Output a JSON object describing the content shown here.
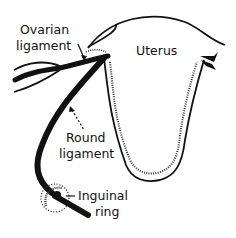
{
  "diagram": {
    "labels": {
      "ovarian_ligament": [
        "Ovarian",
        "ligament"
      ],
      "uterus": "Uterus",
      "round_ligament": [
        "Round",
        "ligament"
      ],
      "inguinal_ring": [
        "Inguinal",
        "ring"
      ]
    },
    "colors": {
      "ink": "#111111",
      "background": "#ffffff"
    }
  }
}
